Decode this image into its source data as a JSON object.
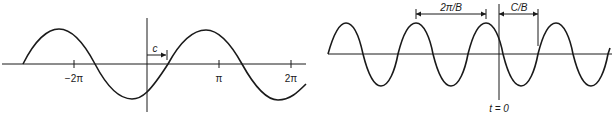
{
  "left_panel": {
    "title": "",
    "tick_labels": [
      "−2π",
      "π",
      "2π"
    ],
    "shift_label": "c",
    "colors": {
      "stroke": "#1a1a1a",
      "background": "#ffffff"
    }
  },
  "right_panel": {
    "period_label": "2π/B",
    "shift_label": "C/B",
    "origin_label": "t = 0",
    "colors": {
      "stroke": "#1a1a1a",
      "background": "#ffffff"
    }
  }
}
